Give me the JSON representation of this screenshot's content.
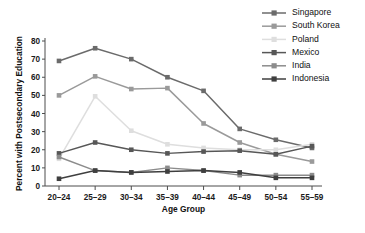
{
  "chart_data": {
    "type": "line",
    "title": "",
    "xlabel": "Age Group",
    "ylabel": "Percent with Postsecondary Education",
    "categories": [
      "20–24",
      "25–29",
      "30–34",
      "35–39",
      "40–44",
      "45–49",
      "50–54",
      "55–59"
    ],
    "ylim": [
      0,
      80
    ],
    "yticks": [
      0,
      10,
      20,
      30,
      40,
      50,
      60,
      70,
      80
    ],
    "grid": false,
    "legend_position": "top-right",
    "marker": "square",
    "series": [
      {
        "name": "Singapore",
        "color": "#6b6b6b",
        "values": [
          69.0,
          76.0,
          70.0,
          60.0,
          52.5,
          31.5,
          25.5,
          21.0
        ]
      },
      {
        "name": "South Korea",
        "color": "#9a9a9a",
        "values": [
          50.0,
          60.5,
          53.5,
          54.0,
          34.5,
          24.0,
          17.5,
          13.5
        ]
      },
      {
        "name": "Poland",
        "color": "#dedede",
        "values": [
          15.0,
          49.5,
          30.5,
          23.0,
          21.0,
          20.0,
          20.0,
          23.0
        ]
      },
      {
        "name": "Mexico",
        "color": "#575757",
        "values": [
          18.0,
          24.0,
          20.0,
          18.0,
          19.0,
          19.5,
          17.5,
          22.0
        ]
      },
      {
        "name": "India",
        "color": "#8c8c8c",
        "values": [
          16.0,
          8.5,
          7.5,
          10.0,
          8.5,
          6.0,
          6.0,
          6.0
        ]
      },
      {
        "name": "Indonesia",
        "color": "#3f3f3f",
        "values": [
          4.0,
          8.5,
          7.5,
          8.0,
          8.5,
          7.5,
          4.5,
          4.5
        ]
      }
    ]
  },
  "legend": {
    "entries": [
      {
        "label": "Singapore"
      },
      {
        "label": "South Korea"
      },
      {
        "label": "Poland"
      },
      {
        "label": "Mexico"
      },
      {
        "label": "India"
      },
      {
        "label": "Indonesia"
      }
    ]
  },
  "axes": {
    "y_title": "Percent with Postsecondary Education",
    "x_title": "Age Group"
  }
}
